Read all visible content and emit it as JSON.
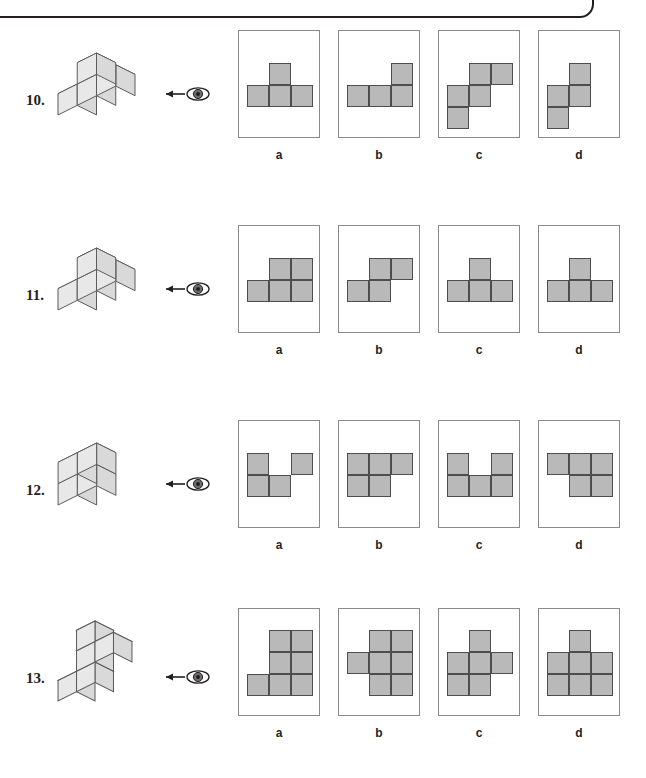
{
  "page": {
    "cell_fill": "#b9b9b9",
    "cell_stroke": "#4d4d4d",
    "box_stroke": "#8a8a8a",
    "ink": "#231f20",
    "cube_face_top": "#f2f2f2",
    "cube_face_left": "#d9d9d9",
    "cube_face_right": "#e8e8e8"
  },
  "option_letters": [
    "a",
    "b",
    "c",
    "d"
  ],
  "questions": [
    {
      "number": "10.",
      "top": 30,
      "grid_cols": 3,
      "grid_rows": 2,
      "cube_solid": [
        {
          "x": 0,
          "y": 0,
          "z": 0
        },
        {
          "x": 1,
          "y": 0,
          "z": 0
        },
        {
          "x": 2,
          "y": 0,
          "z": 0
        },
        {
          "x": 1,
          "y": 1,
          "z": 0
        }
      ],
      "options": [
        {
          "letter": "a",
          "name": "t-shape",
          "cells": [
            [
              1,
              0
            ],
            [
              0,
              1
            ],
            [
              1,
              1
            ],
            [
              2,
              1
            ]
          ]
        },
        {
          "letter": "b",
          "name": "l-shape",
          "cells": [
            [
              2,
              0
            ],
            [
              0,
              1
            ],
            [
              1,
              1
            ],
            [
              2,
              1
            ]
          ]
        },
        {
          "letter": "c",
          "name": "w-stair-shape",
          "cells": [
            [
              1,
              0
            ],
            [
              2,
              0
            ],
            [
              0,
              1
            ],
            [
              1,
              1
            ],
            [
              0,
              2
            ]
          ]
        },
        {
          "letter": "d",
          "name": "s-shape",
          "cells": [
            [
              1,
              0
            ],
            [
              0,
              1
            ],
            [
              1,
              1
            ],
            [
              0,
              2
            ]
          ]
        }
      ]
    },
    {
      "number": "11.",
      "top": 225,
      "grid_cols": 3,
      "grid_rows": 2,
      "cube_solid": [
        {
          "x": 0,
          "y": 0,
          "z": 0
        },
        {
          "x": 1,
          "y": 0,
          "z": 0
        },
        {
          "x": 2,
          "y": 0,
          "z": 0
        },
        {
          "x": 1,
          "y": 1,
          "z": 0
        }
      ],
      "options": [
        {
          "letter": "a",
          "name": "p-shape",
          "cells": [
            [
              1,
              0
            ],
            [
              2,
              0
            ],
            [
              0,
              1
            ],
            [
              1,
              1
            ],
            [
              2,
              1
            ]
          ]
        },
        {
          "letter": "b",
          "name": "s-shape",
          "cells": [
            [
              1,
              0
            ],
            [
              2,
              0
            ],
            [
              0,
              1
            ],
            [
              1,
              1
            ]
          ]
        },
        {
          "letter": "c",
          "name": "t-shape",
          "cells": [
            [
              1,
              0
            ],
            [
              0,
              1
            ],
            [
              1,
              1
            ],
            [
              2,
              1
            ]
          ]
        },
        {
          "letter": "d",
          "name": "t-shape",
          "cells": [
            [
              1,
              0
            ],
            [
              0,
              1
            ],
            [
              1,
              1
            ],
            [
              2,
              1
            ]
          ]
        }
      ]
    },
    {
      "number": "12.",
      "top": 420,
      "grid_cols": 3,
      "grid_rows": 2,
      "cube_solid": [
        {
          "x": 0,
          "y": 0,
          "z": 0
        },
        {
          "x": 1,
          "y": 0,
          "z": 0
        },
        {
          "x": 0,
          "y": 1,
          "z": 0
        },
        {
          "x": 1,
          "y": 1,
          "z": 0
        }
      ],
      "options": [
        {
          "letter": "a",
          "name": "broken-u-shape",
          "cells": [
            [
              0,
              0
            ],
            [
              2,
              0
            ],
            [
              0,
              1
            ],
            [
              1,
              1
            ]
          ]
        },
        {
          "letter": "b",
          "name": "p-shape",
          "cells": [
            [
              0,
              0
            ],
            [
              1,
              0
            ],
            [
              2,
              0
            ],
            [
              0,
              1
            ],
            [
              1,
              1
            ]
          ]
        },
        {
          "letter": "c",
          "name": "u-shape",
          "cells": [
            [
              0,
              0
            ],
            [
              2,
              0
            ],
            [
              0,
              1
            ],
            [
              1,
              1
            ],
            [
              2,
              1
            ]
          ]
        },
        {
          "letter": "d",
          "name": "z-shape",
          "cells": [
            [
              0,
              0
            ],
            [
              1,
              0
            ],
            [
              2,
              0
            ],
            [
              1,
              1
            ],
            [
              2,
              1
            ]
          ]
        }
      ]
    },
    {
      "number": "13.",
      "top": 608,
      "grid_cols": 3,
      "grid_rows": 3,
      "cube_solid": [
        {
          "x": 0,
          "y": 0,
          "z": 0
        },
        {
          "x": 1,
          "y": 0,
          "z": 0
        },
        {
          "x": 1,
          "y": 1,
          "z": 0
        },
        {
          "x": 1,
          "y": 2,
          "z": 0
        },
        {
          "x": 2,
          "y": 1,
          "z": 0
        }
      ],
      "options": [
        {
          "letter": "a",
          "name": "stair-shape",
          "cells": [
            [
              1,
              0
            ],
            [
              2,
              0
            ],
            [
              1,
              1
            ],
            [
              2,
              1
            ],
            [
              0,
              2
            ],
            [
              1,
              2
            ],
            [
              2,
              2
            ]
          ]
        },
        {
          "letter": "b",
          "name": "offset-plus-shape",
          "cells": [
            [
              1,
              0
            ],
            [
              2,
              0
            ],
            [
              0,
              1
            ],
            [
              1,
              1
            ],
            [
              2,
              1
            ],
            [
              1,
              2
            ],
            [
              2,
              2
            ]
          ]
        },
        {
          "letter": "c",
          "name": "cross-shape",
          "cells": [
            [
              1,
              0
            ],
            [
              0,
              1
            ],
            [
              1,
              1
            ],
            [
              2,
              1
            ],
            [
              0,
              2
            ],
            [
              1,
              2
            ]
          ]
        },
        {
          "letter": "d",
          "name": "t-block-shape",
          "cells": [
            [
              1,
              0
            ],
            [
              0,
              1
            ],
            [
              1,
              1
            ],
            [
              2,
              1
            ],
            [
              0,
              2
            ],
            [
              1,
              2
            ],
            [
              2,
              2
            ]
          ]
        }
      ]
    }
  ]
}
